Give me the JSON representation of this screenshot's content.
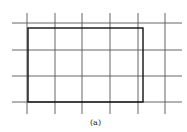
{
  "figure": {
    "caption": "(a)",
    "grid": {
      "vertical_lines_x": [
        27,
        55,
        82,
        110,
        138,
        165
      ],
      "vertical_extent_y": [
        13,
        114
      ],
      "horizontal_lines_y": [
        23,
        50,
        76,
        102
      ],
      "horizontal_extent_x": [
        12,
        182
      ],
      "line_color": "#555555"
    },
    "rectangle": {
      "x": 28,
      "y": 28,
      "width": 115,
      "height": 74,
      "stroke_color": "#111111"
    }
  }
}
